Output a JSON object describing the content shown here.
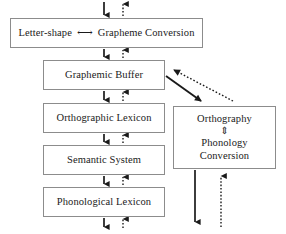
{
  "diagram": {
    "colors": {
      "box_border": "#8c8c8c",
      "box_fill": "#ffffff",
      "arrow_solid": "#1a1a1a",
      "arrow_dotted": "#1a1a1a",
      "text": "#1a1a1a"
    },
    "boxes": [
      {
        "id": "letter-shape",
        "label_left": "Letter-shape",
        "label_symbol": "⟷",
        "label_right": "Grapheme Conversion"
      },
      {
        "id": "graphemic-buffer",
        "label": "Graphemic Buffer"
      },
      {
        "id": "orthographic-lexicon",
        "label": "Orthographic Lexicon"
      },
      {
        "id": "semantic-system",
        "label": "Semantic System"
      },
      {
        "id": "phonological-lexicon",
        "label": "Phonological Lexicon"
      },
      {
        "id": "orthography-phonology-conversion",
        "line1": "Orthography",
        "symbol": "⇕",
        "line2": "Phonology",
        "line3": "Conversion"
      }
    ],
    "arrows": [
      {
        "id": "top-in-solid-down",
        "style": "solid",
        "direction": "down"
      },
      {
        "id": "top-in-dotted-up",
        "style": "dotted",
        "direction": "up"
      },
      {
        "id": "letter-to-buffer-solid-down",
        "style": "solid",
        "direction": "down"
      },
      {
        "id": "buffer-to-letter-dotted-up",
        "style": "dotted",
        "direction": "up"
      },
      {
        "id": "buffer-to-orthlex-solid-down",
        "style": "solid",
        "direction": "down"
      },
      {
        "id": "orthlex-to-buffer-dotted-up",
        "style": "dotted",
        "direction": "up"
      },
      {
        "id": "orthlex-to-semantic-solid-down",
        "style": "solid",
        "direction": "down"
      },
      {
        "id": "semantic-to-orthlex-dotted-up",
        "style": "dotted",
        "direction": "up"
      },
      {
        "id": "semantic-to-phonlex-solid-down",
        "style": "solid",
        "direction": "down"
      },
      {
        "id": "phonlex-to-semantic-dotted-up",
        "style": "dotted",
        "direction": "up"
      },
      {
        "id": "phonlex-out-solid-down",
        "style": "solid",
        "direction": "down"
      },
      {
        "id": "phonlex-in-dotted-up",
        "style": "dotted",
        "direction": "up"
      },
      {
        "id": "buffer-to-conversion-solid-diagonal",
        "style": "solid",
        "direction": "down-right"
      },
      {
        "id": "conversion-to-buffer-dotted-diagonal",
        "style": "dotted",
        "direction": "up-left"
      },
      {
        "id": "conversion-out-solid-down",
        "style": "solid",
        "direction": "down"
      },
      {
        "id": "conversion-in-dotted-up",
        "style": "dotted",
        "direction": "up"
      }
    ]
  }
}
